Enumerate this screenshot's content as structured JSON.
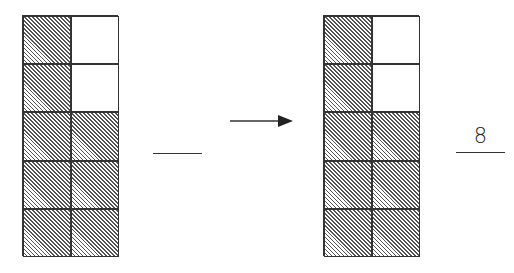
{
  "figure": {
    "left_grid": {
      "rows": 5,
      "cols": 2,
      "cells": [
        [
          true,
          false
        ],
        [
          true,
          false
        ],
        [
          true,
          true
        ],
        [
          true,
          true
        ],
        [
          true,
          true
        ]
      ],
      "shaded_count": 8
    },
    "left_blank": "",
    "arrow": "right",
    "right_grid": {
      "rows": 5,
      "cols": 2,
      "cells": [
        [
          true,
          false
        ],
        [
          true,
          false
        ],
        [
          true,
          true
        ],
        [
          true,
          true
        ],
        [
          true,
          true
        ]
      ],
      "shaded_count": 8
    },
    "right_answer": "8"
  }
}
